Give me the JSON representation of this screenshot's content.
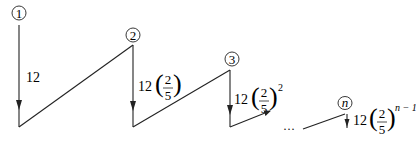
{
  "diagram": {
    "type": "bouncing-ball-sawtooth",
    "nodes": [
      {
        "id": "1",
        "label": "1",
        "drop_label": {
          "coef": "12",
          "has_fraction": false
        }
      },
      {
        "id": "2",
        "label": "2",
        "drop_label": {
          "coef": "12",
          "has_fraction": true,
          "num": "2",
          "den": "5",
          "exponent": ""
        }
      },
      {
        "id": "3",
        "label": "3",
        "drop_label": {
          "coef": "12",
          "has_fraction": true,
          "num": "2",
          "den": "5",
          "exponent": "2"
        }
      },
      {
        "id": "n",
        "label": "n",
        "drop_label": {
          "coef": "12",
          "has_fraction": true,
          "num": "2",
          "den": "5",
          "exponent": "n − 1"
        }
      }
    ],
    "ellipsis": "···",
    "line_color": "#222222"
  }
}
